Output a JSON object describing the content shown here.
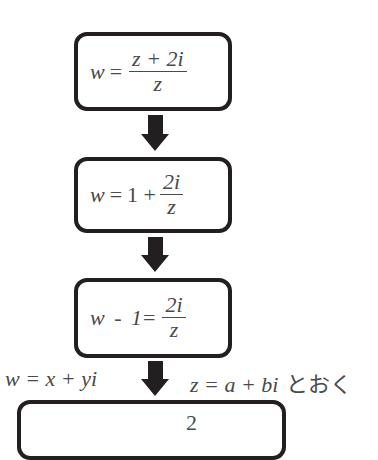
{
  "diagram": {
    "type": "flowchart",
    "steps": [
      {
        "lhs": "w",
        "eq": "=",
        "num": "z + 2i",
        "den": "z"
      },
      {
        "lhs": "w",
        "eq": "=",
        "pre": "1 +",
        "num": "2i",
        "den": "z"
      },
      {
        "lhs": "w - 1",
        "eq": "=",
        "num": "2i",
        "den": "z"
      },
      {
        "partial_glyph": "2"
      }
    ],
    "transition_3_4": {
      "left_label": "w = x + yi",
      "right_label": "z = a + bi",
      "right_suffix": "とおく"
    },
    "colors": {
      "border": "#231f20",
      "arrow": "#231f20",
      "text": "#4a4a4a"
    }
  }
}
